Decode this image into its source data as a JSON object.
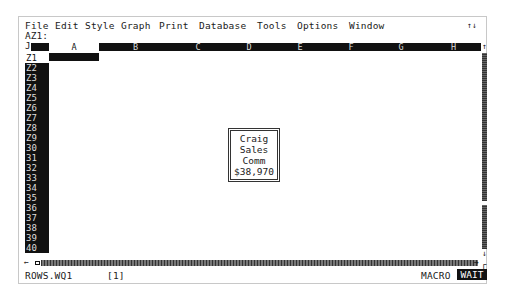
{
  "menubar": {
    "items": [
      "File",
      "Edit",
      "Style",
      "Graph",
      "Print",
      "Database",
      "Tools",
      "Options",
      "Window"
    ],
    "right_indicator": "↑↓"
  },
  "cell_reference": "AZ1:",
  "grid": {
    "corner_glyph": "J",
    "columns": [
      "A",
      "B",
      "C",
      "D",
      "E",
      "F",
      "G",
      "H"
    ],
    "selected_column": "A",
    "rows": [
      "Z1",
      "Z2",
      "Z3",
      "Z4",
      "Z5",
      "Z6",
      "Z7",
      "Z8",
      "Z9",
      "30",
      "31",
      "32",
      "33",
      "34",
      "35",
      "36",
      "37",
      "38",
      "39",
      "40"
    ],
    "selected_row": "Z1"
  },
  "text_box": {
    "lines": [
      "Craig",
      "Sales",
      "Comm",
      "$38,970"
    ]
  },
  "scrollbars": {
    "up_arrow": "↑",
    "down_arrow": "↓",
    "left_arrow": "←",
    "right_arrow": "→"
  },
  "statusbar": {
    "filename": "ROWS.WQ1",
    "window_number": "[1]",
    "macro_indicator": "MACRO",
    "mode_indicator": "WAIT"
  }
}
